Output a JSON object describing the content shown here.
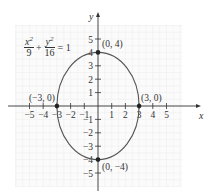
{
  "chart_data": {
    "type": "line",
    "title": "",
    "equation": {
      "x_term_num": "x",
      "x_term_den": "9",
      "y_term_num": "y",
      "y_term_den": "16",
      "plus": "+",
      "equals": "= 1",
      "exp": "2"
    },
    "xlabel": "x",
    "ylabel": "y",
    "xlim": [
      -5.5,
      5.5
    ],
    "ylim": [
      -5.5,
      5.5
    ],
    "grid": true,
    "x_ticks": [
      -5,
      -4,
      -3,
      -2,
      -1,
      1,
      2,
      3,
      4,
      5
    ],
    "y_ticks": [
      -5,
      -4,
      -3,
      -2,
      -1,
      1,
      2,
      3,
      4,
      5
    ],
    "series": [
      {
        "name": "ellipse",
        "curve": "x^2/9 + y^2/16 = 1",
        "a": 3,
        "b": 4
      }
    ],
    "points": [
      {
        "x": 0,
        "y": 4,
        "label": "(0, 4)"
      },
      {
        "x": 0,
        "y": -4,
        "label": "(0, −4)"
      },
      {
        "x": -3,
        "y": 0,
        "label": "(−3, 0)"
      },
      {
        "x": 3,
        "y": 0,
        "label": "(3, 0)"
      }
    ],
    "colors": {
      "curve": "#555555",
      "axis": "#333333",
      "grid": "#ececec",
      "point": "#222222"
    }
  }
}
